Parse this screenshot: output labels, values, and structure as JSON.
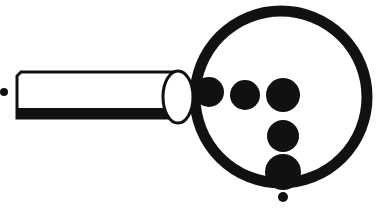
{
  "image": {
    "title": "Magnifying Glass",
    "description": "Black and white clip-art line drawing of a magnifying glass with a long straight handle, a round lens rim, and six solid dots of varying sizes arranged inside and around the lens.",
    "style": "black-and-white line art clipart",
    "width": 388,
    "height": 211,
    "background_color": "#ffffff",
    "ink_color": "#111111"
  },
  "shapes": {
    "lens_rim": {
      "name": "lens-rim",
      "label": "Lens rim circle",
      "cx": 281,
      "cy": 97,
      "r": 86,
      "stroke_width": 11,
      "fill": "none",
      "stroke": "#111111"
    },
    "handle": {
      "name": "handle",
      "label": "Magnifier handle",
      "x1": 17,
      "y1": 72,
      "x2": 180,
      "y2": 118,
      "outline_width": 3,
      "bottom_band_height": 10,
      "fill": "#ffffff",
      "stroke": "#111111"
    },
    "ferrule": {
      "name": "ferrule",
      "label": "White collar between handle and lens",
      "cx": 178,
      "cy": 97,
      "rx": 15,
      "ry": 26,
      "stroke_width": 3,
      "fill": "#ffffff",
      "stroke": "#111111"
    },
    "dots": [
      {
        "name": "dot-left-edge",
        "label": "Dot on left rim",
        "cx": 209,
        "cy": 92,
        "r": 15
      },
      {
        "name": "dot-top-middle",
        "label": "Top row middle dot",
        "cx": 245,
        "cy": 95,
        "r": 15
      },
      {
        "name": "dot-top-right",
        "label": "Top row right dot",
        "cx": 283,
        "cy": 95,
        "r": 17
      },
      {
        "name": "dot-center-lower",
        "label": "Center lower dot",
        "cx": 283,
        "cy": 136,
        "r": 16
      },
      {
        "name": "dot-bottom-rim",
        "label": "Dot straddling bottom rim",
        "cx": 283,
        "cy": 172,
        "r": 18
      },
      {
        "name": "dot-below-rim",
        "label": "Small dot below rim",
        "cx": 283,
        "cy": 197,
        "r": 5
      },
      {
        "name": "dot-far-left",
        "label": "Small dot left of handle",
        "cx": 4,
        "cy": 92,
        "r": 4
      }
    ]
  }
}
